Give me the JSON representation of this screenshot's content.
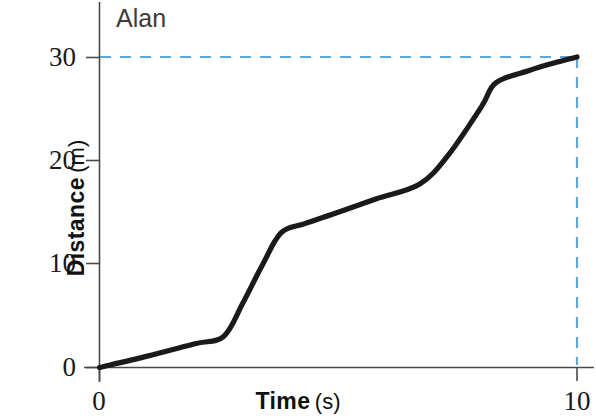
{
  "chart_data": {
    "type": "line",
    "title": "",
    "series_label": "Alan",
    "xlabel_bold": "Time",
    "xlabel_unit": "(s)",
    "ylabel_bold": "Distance",
    "ylabel_unit": "(m)",
    "xlim": [
      0,
      10
    ],
    "ylim": [
      0,
      30
    ],
    "xticks": [
      0,
      10
    ],
    "xtick_labels": [
      "0",
      "10"
    ],
    "yticks": [
      0,
      10,
      20,
      30
    ],
    "ytick_labels": [
      "0",
      "10",
      "20",
      "30"
    ],
    "grid": false,
    "legend_position": "none",
    "line_color": "#1a1a1a",
    "guide_color": "#5ba7de",
    "axis_color": "#4a4a4a",
    "series": [
      {
        "name": "Alan",
        "x": [
          0,
          1.0,
          2.0,
          2.6,
          3.0,
          3.4,
          3.8,
          4.3,
          5.0,
          5.8,
          6.7,
          7.3,
          8.0,
          8.3,
          9.0,
          9.5,
          10.0
        ],
        "values": [
          0,
          1.1,
          2.3,
          3.0,
          6.2,
          9.8,
          13.0,
          13.9,
          15.0,
          16.3,
          17.7,
          20.5,
          25.2,
          27.5,
          28.7,
          29.4,
          30.0
        ]
      }
    ],
    "annotations": [
      {
        "name": "horizontal-guide",
        "type": "dashed-line",
        "orientation": "horizontal",
        "value": 30,
        "from_x": 0,
        "to_x": 10
      },
      {
        "name": "vertical-guide",
        "type": "dashed-line",
        "orientation": "vertical",
        "value": 10,
        "from_y": 0,
        "to_y": 30
      }
    ]
  }
}
